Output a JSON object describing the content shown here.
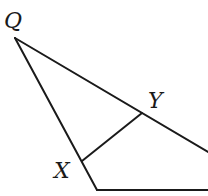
{
  "diagram": {
    "type": "geometry-triangle",
    "labels": {
      "q": "Q",
      "y": "Y",
      "x": "X"
    },
    "points": {
      "Q": [
        15,
        38
      ],
      "Y": [
        142,
        113
      ],
      "X": [
        82,
        161
      ],
      "bottom_left": [
        97,
        190
      ],
      "bottom_right": [
        208,
        190
      ],
      "hyp_end": [
        208,
        152
      ]
    },
    "segments": [
      {
        "name": "QY-extended",
        "from": "Q",
        "to": "hyp_end"
      },
      {
        "name": "QX-extended",
        "from": "Q",
        "to": "bottom_left"
      },
      {
        "name": "XY",
        "from": "X",
        "to": "Y"
      },
      {
        "name": "base",
        "from": "bottom_left",
        "to": "bottom_right"
      }
    ],
    "stroke_color": "#1a1a1a",
    "background": "#ffffff"
  }
}
